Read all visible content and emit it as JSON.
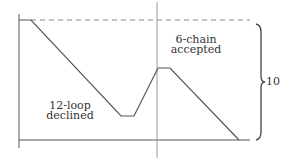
{
  "diagram": {
    "labels": {
      "left_region": [
        "12-loop",
        "declined"
      ],
      "right_region": [
        "6-chain",
        "accepted"
      ],
      "brace_value": "10"
    },
    "colors": {
      "line": "#555555",
      "dashed": "#888888",
      "background": "#ffffff"
    },
    "trace_points": [
      [
        19,
        20
      ],
      [
        31,
        20
      ],
      [
        121,
        116
      ],
      [
        134,
        116
      ],
      [
        158,
        68
      ],
      [
        170,
        68
      ],
      [
        239,
        140
      ]
    ]
  }
}
